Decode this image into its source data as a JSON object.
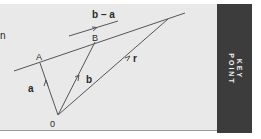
{
  "diagram": {
    "partial_text": "n",
    "labels": {
      "point_a": "A",
      "point_b": "B",
      "origin": "0",
      "vector_a": "a",
      "vector_b": "b",
      "vector_r": "r",
      "difference": "b – a"
    },
    "colors": {
      "panel_bg": "#e9e9e9",
      "line": "#555555",
      "key_bg": "#3c3c3c",
      "key_text": "#f2f2f2"
    }
  },
  "key_point": {
    "line1": "KEY",
    "line2": "POINT"
  }
}
